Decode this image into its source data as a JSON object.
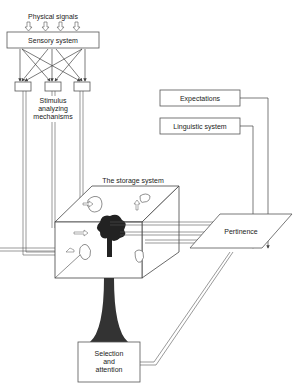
{
  "diagram": {
    "nodes": {
      "physical_signals": "Physical signals",
      "sensory_system": "Sensory system",
      "stimulus_analyzing": [
        "Stimulus",
        "analyzing",
        "mechanisms"
      ],
      "expectations": "Expectations",
      "linguistic_system": "Linguistic system",
      "storage_system": "The storage system",
      "pertinence": "Pertinence",
      "selection_attention": [
        "Selection",
        "and",
        "attention"
      ]
    },
    "edges": [
      {
        "from": "physical_signals",
        "to": "sensory_system",
        "count": 4
      },
      {
        "from": "sensory_system",
        "to": "stimulus_analyzing",
        "type": "crossing"
      },
      {
        "from": "stimulus_analyzing",
        "to": "storage_system",
        "type": "double-line"
      },
      {
        "from": "expectations",
        "to": "pertinence"
      },
      {
        "from": "linguistic_system",
        "to": "pertinence"
      },
      {
        "from": "storage_system",
        "to": "pertinence",
        "type": "double-line"
      },
      {
        "from": "storage_system",
        "to": "selection_attention",
        "type": "funnel"
      },
      {
        "from": "selection_attention",
        "to": "pertinence",
        "type": "double-line"
      }
    ],
    "colors": {
      "line": "#444444",
      "fill_dark": "#333333",
      "background": "#ffffff"
    }
  }
}
